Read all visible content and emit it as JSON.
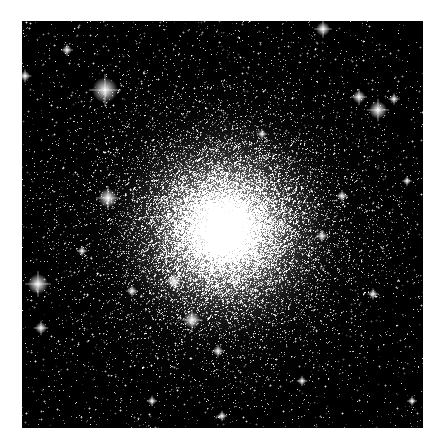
{
  "image": {
    "subject": "globular star cluster",
    "description": "Dense globular cluster of stars with a bright concentrated core against a black sky, surrounded by scattered field stars",
    "colors": {
      "background": "#ffffff",
      "sky": "#000000",
      "core": "#ffffff",
      "star": "#f2f2f2"
    }
  }
}
